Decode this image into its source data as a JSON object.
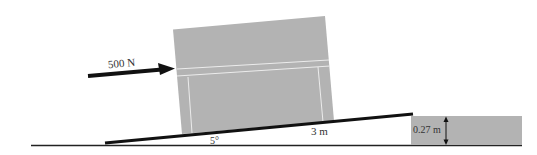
{
  "diagram": {
    "type": "physics-free-body",
    "force": {
      "label": "500 N",
      "direction": "horizontal-right (slightly up)"
    },
    "ramp": {
      "angle_label": "5°",
      "length_label": "3 m"
    },
    "step": {
      "height_label": "0.27 m"
    },
    "colors": {
      "box_fill": "#b3b3b3",
      "box_lines": "#e8e8e8",
      "step_fill": "#b3b3b3",
      "ink": "#111111",
      "background": "#ffffff"
    }
  }
}
